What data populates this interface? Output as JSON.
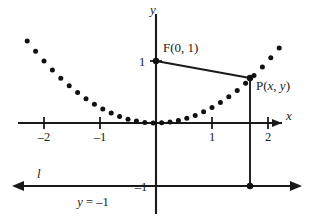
{
  "figure": {
    "background_color": "#ffffff",
    "ink_color": "#1a1a1a"
  },
  "axes": {
    "x_axis_label": "x",
    "y_axis_label": "y",
    "x_ticks": [
      {
        "value": -2,
        "label": "–2"
      },
      {
        "value": -1,
        "label": "–1"
      },
      {
        "value": 1,
        "label": "1"
      },
      {
        "value": 2,
        "label": "2"
      }
    ],
    "y_ticks": [
      {
        "value": 1,
        "label": "1"
      },
      {
        "value": -1,
        "label": "–1"
      }
    ]
  },
  "labels": {
    "focus": "F(0, 1)",
    "point_prefix": "P(",
    "point_x": "x",
    "point_sep": ", ",
    "point_y": "y",
    "point_suffix": ")",
    "directrix_name": "l",
    "directrix_equation_lhs": "y",
    "directrix_equation_rhs": " = –1"
  },
  "chart_data": {
    "type": "scatter",
    "title": "",
    "xlabel": "x",
    "ylabel": "y",
    "xlim": [
      -2.5,
      2.4
    ],
    "ylim": [
      -1.3,
      1.6
    ],
    "grid": false,
    "legend": "none",
    "curve": {
      "name": "y = x²/4",
      "equation": "y = x^2/4",
      "style": "dotted",
      "x": [
        -2.3,
        -2.15,
        -2.0,
        -1.85,
        -1.7,
        -1.55,
        -1.4,
        -1.25,
        -1.1,
        -0.95,
        -0.8,
        -0.65,
        -0.5,
        -0.35,
        -0.2,
        -0.05,
        0.1,
        0.25,
        0.4,
        0.55,
        0.7,
        0.85,
        1.0,
        1.15,
        1.3,
        1.45,
        1.6,
        1.75,
        1.9,
        2.05,
        2.2
      ],
      "y": [
        1.3225,
        1.1556,
        1.0,
        0.8556,
        0.7225,
        0.6006,
        0.49,
        0.3906,
        0.3025,
        0.2256,
        0.16,
        0.1056,
        0.0625,
        0.0306,
        0.01,
        0.0006,
        0.0025,
        0.0156,
        0.04,
        0.0756,
        0.1225,
        0.1806,
        0.25,
        0.3306,
        0.4225,
        0.5256,
        0.64,
        0.7656,
        0.9025,
        1.0506,
        1.21
      ]
    },
    "annotations": [
      {
        "name": "focus",
        "label": "F(0, 1)",
        "x": 0,
        "y": 1
      },
      {
        "name": "point-on-parabola",
        "label": "P(x, y)",
        "x": 1.68,
        "y": 0.7056
      },
      {
        "name": "foot-on-directrix",
        "label": "",
        "x": 1.68,
        "y": -1
      }
    ],
    "segments": [
      {
        "name": "focal-radius",
        "from": [
          0,
          1
        ],
        "to": [
          1.68,
          0.7056
        ]
      },
      {
        "name": "distance-to-directrix",
        "from": [
          1.68,
          0.7056
        ],
        "to": [
          1.68,
          -1
        ]
      }
    ],
    "lines": [
      {
        "name": "directrix",
        "equation": "y = -1",
        "label": "l",
        "y": -1
      }
    ]
  }
}
